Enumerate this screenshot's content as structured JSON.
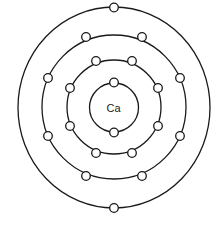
{
  "diagram": {
    "nucleus_label": "Ca",
    "center": [
      114,
      107.5
    ],
    "shells": [
      {
        "name": "shell-1",
        "radius": 24.5,
        "electrons": 2
      },
      {
        "name": "shell-2",
        "radius": 48,
        "electrons": 8
      },
      {
        "name": "shell-3",
        "radius": 73,
        "electrons": 8
      },
      {
        "name": "shell-4",
        "radius": 100,
        "electrons": 2
      }
    ],
    "colors": {
      "line": "#1a1a1a",
      "electron_fill": "#ffffff",
      "background": "#ffffff"
    }
  }
}
